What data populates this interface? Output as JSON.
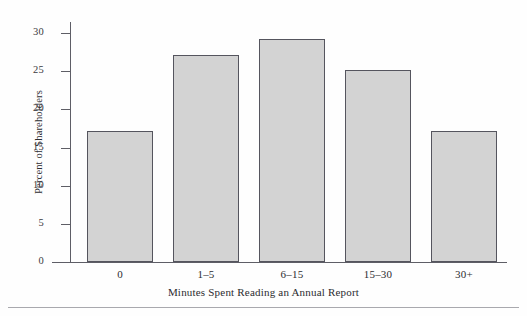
{
  "chart_data": {
    "type": "bar",
    "title": "",
    "subtitle": "",
    "xlabel": "Minutes Spent Reading an Annual Report",
    "ylabel": "Percent of Shareholders",
    "categories": [
      "0",
      "1–5",
      "6–15",
      "15–30",
      "30+"
    ],
    "values": [
      17.2,
      27.1,
      29.2,
      25.1,
      17.2
    ],
    "ylim": [
      0,
      31
    ],
    "yticks": [
      0,
      5,
      10,
      15,
      20,
      25,
      30
    ],
    "ytick_labels": [
      "0",
      "5",
      "10",
      "15",
      "20",
      "25",
      "30"
    ],
    "grid": false,
    "legend": null,
    "legend_position": "none",
    "bar_fill_color": "#d3d3d3",
    "bar_edge_color": "#55555e",
    "axis_color": "#5e5e66",
    "background_color": "#fefefe",
    "text_color": "#2c2c30",
    "annotations": []
  },
  "figure": {
    "bottom_rule_color": "#a9a9ae"
  }
}
